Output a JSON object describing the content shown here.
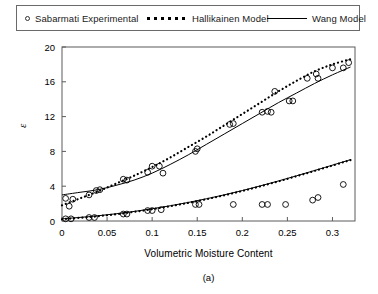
{
  "legend": {
    "entries": [
      {
        "label": "Sabarmati Experimental",
        "style": "circle-marker",
        "icon": "open-circle-marker-icon"
      },
      {
        "label": "Hallikainen Model",
        "style": "dotted-line",
        "icon": "dotted-line-icon"
      },
      {
        "label": "Wang Model",
        "style": "solid-line",
        "icon": "solid-line-icon"
      }
    ]
  },
  "caption": "(a)",
  "chart_data": {
    "type": "scatter",
    "title": "",
    "subtitle": "",
    "xlabel": "Volumetric Moisture Content",
    "ylabel": "ε",
    "xlim": [
      0,
      0.325
    ],
    "ylim": [
      0,
      20
    ],
    "xticks": [
      0,
      0.05,
      0.1,
      0.15,
      0.2,
      0.25,
      0.3
    ],
    "xticklabels": [
      "0",
      "0.05",
      "0.1",
      "0.15",
      "0.2",
      "0.25",
      "0.3"
    ],
    "yticks": [
      0,
      4,
      8,
      12,
      16,
      20
    ],
    "yticklabels": [
      "0",
      "4",
      "8",
      "12",
      "16",
      "20"
    ],
    "grid": false,
    "legend_position": "above-plot",
    "axis_box": true,
    "series": [
      {
        "name": "Sabarmati Experimental (real part)",
        "marker": "open-circle",
        "line": "none",
        "color": "#000000",
        "points": [
          [
            0.004,
            2.6
          ],
          [
            0.008,
            1.7
          ],
          [
            0.012,
            2.5
          ],
          [
            0.03,
            3.0
          ],
          [
            0.038,
            3.5
          ],
          [
            0.042,
            3.6
          ],
          [
            0.068,
            4.8
          ],
          [
            0.072,
            4.7
          ],
          [
            0.095,
            5.6
          ],
          [
            0.1,
            6.3
          ],
          [
            0.108,
            6.3
          ],
          [
            0.112,
            5.5
          ],
          [
            0.148,
            8.0
          ],
          [
            0.15,
            8.3
          ],
          [
            0.186,
            11.1
          ],
          [
            0.19,
            11.2
          ],
          [
            0.222,
            12.5
          ],
          [
            0.228,
            12.6
          ],
          [
            0.232,
            12.5
          ],
          [
            0.236,
            14.9
          ],
          [
            0.252,
            13.8
          ],
          [
            0.256,
            13.8
          ],
          [
            0.272,
            16.4
          ],
          [
            0.282,
            16.9
          ],
          [
            0.284,
            16.4
          ],
          [
            0.3,
            17.6
          ],
          [
            0.312,
            17.6
          ],
          [
            0.318,
            18.2
          ]
        ]
      },
      {
        "name": "Hallikainen Model (real part)",
        "marker": "none",
        "line": "dotted",
        "color": "#000000",
        "x": [
          0.0,
          0.02,
          0.04,
          0.06,
          0.08,
          0.1,
          0.12,
          0.14,
          0.16,
          0.18,
          0.2,
          0.22,
          0.24,
          0.26,
          0.28,
          0.3,
          0.32
        ],
        "y": [
          1.8,
          2.6,
          3.4,
          4.3,
          5.2,
          6.2,
          7.3,
          8.5,
          9.7,
          11.0,
          12.3,
          13.6,
          14.9,
          16.1,
          17.2,
          18.0,
          18.6
        ]
      },
      {
        "name": "Wang Model (real part)",
        "marker": "none",
        "line": "solid",
        "color": "#000000",
        "x": [
          0.0,
          0.02,
          0.04,
          0.06,
          0.08,
          0.1,
          0.12,
          0.14,
          0.16,
          0.18,
          0.2,
          0.22,
          0.24,
          0.26,
          0.28,
          0.3,
          0.32
        ],
        "y": [
          3.0,
          3.3,
          3.6,
          4.1,
          4.7,
          5.5,
          6.5,
          7.6,
          8.8,
          10.0,
          11.2,
          12.4,
          13.6,
          14.7,
          15.8,
          16.8,
          17.7
        ]
      },
      {
        "name": "Sabarmati Experimental (imaginary part)",
        "marker": "open-circle",
        "line": "none",
        "color": "#000000",
        "points": [
          [
            0.004,
            0.25
          ],
          [
            0.01,
            0.25
          ],
          [
            0.03,
            0.4
          ],
          [
            0.036,
            0.4
          ],
          [
            0.068,
            0.8
          ],
          [
            0.072,
            0.8
          ],
          [
            0.095,
            1.2
          ],
          [
            0.1,
            1.2
          ],
          [
            0.11,
            1.3
          ],
          [
            0.148,
            1.9
          ],
          [
            0.152,
            1.9
          ],
          [
            0.19,
            1.9
          ],
          [
            0.222,
            1.9
          ],
          [
            0.228,
            1.9
          ],
          [
            0.248,
            1.9
          ],
          [
            0.278,
            2.4
          ],
          [
            0.284,
            2.7
          ],
          [
            0.312,
            4.2
          ]
        ]
      },
      {
        "name": "Hallikainen Model (imaginary part)",
        "marker": "none",
        "line": "dotted",
        "color": "#000000",
        "x": [
          0.0,
          0.04,
          0.08,
          0.12,
          0.16,
          0.2,
          0.24,
          0.28,
          0.32
        ],
        "y": [
          0.2,
          0.55,
          1.05,
          1.7,
          2.5,
          3.45,
          4.55,
          5.75,
          7.0
        ]
      },
      {
        "name": "Wang Model (imaginary part)",
        "marker": "none",
        "line": "solid",
        "color": "#000000",
        "x": [
          0.0,
          0.04,
          0.08,
          0.12,
          0.16,
          0.2,
          0.24,
          0.28,
          0.32
        ],
        "y": [
          0.25,
          0.6,
          1.1,
          1.75,
          2.55,
          3.5,
          4.6,
          5.8,
          7.05
        ]
      }
    ]
  }
}
